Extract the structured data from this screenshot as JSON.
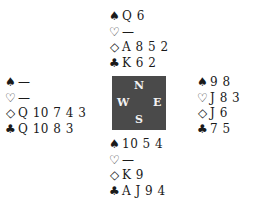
{
  "hands": {
    "north": {
      "spades": "Q 6",
      "hearts": "—",
      "diamonds": "A 8 5 2",
      "clubs": "K 6 2"
    },
    "west": {
      "spades": "—",
      "hearts": "—",
      "diamonds": "Q 10 7 4 3",
      "clubs": "Q 10 8 3"
    },
    "east": {
      "spades": "9 8",
      "hearts": "J 8 3",
      "diamonds": "J 6",
      "clubs": "7 5"
    },
    "south": {
      "spades": "10 5 4",
      "hearts": "—",
      "diamonds": "K 9",
      "clubs": "A J 9 4"
    }
  },
  "symbols": {
    "spades": "♠",
    "hearts": "♡",
    "diamonds": "◇",
    "clubs": "♣"
  },
  "compass": {
    "north": "N",
    "south": "S",
    "west": "W",
    "east": "E",
    "box_color": "#4a4a4a"
  }
}
